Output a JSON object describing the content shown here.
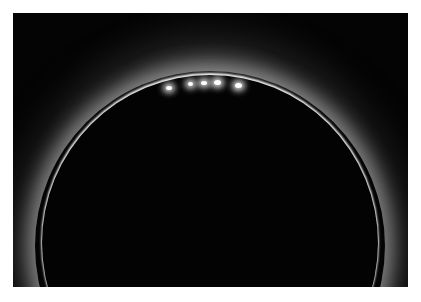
{
  "image": {
    "subject": "total solar eclipse with Baily's beads and corona",
    "background_color": "#ffffff",
    "sky_color": "#040404",
    "moon_disk_color": "#030303",
    "corona_color": "#e6e6e6",
    "beads": [
      {
        "x": 168,
        "y": 87
      },
      {
        "x": 190,
        "y": 83
      },
      {
        "x": 203,
        "y": 82
      },
      {
        "x": 216,
        "y": 81
      },
      {
        "x": 237,
        "y": 84
      }
    ]
  }
}
